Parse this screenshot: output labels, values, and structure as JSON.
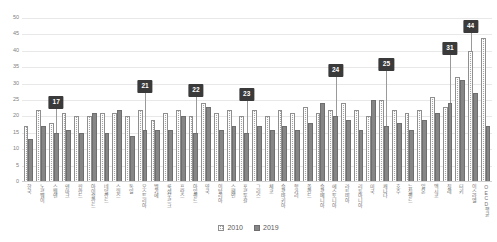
{
  "chart_data": {
    "type": "bar",
    "title": "",
    "subtitle": "",
    "xlabel": "",
    "ylabel": "",
    "ylim": [
      0,
      50
    ],
    "ytick_step": 5,
    "yticks": [
      "0",
      "5",
      "10",
      "15",
      "20",
      "25",
      "30",
      "35",
      "40",
      "45",
      "50"
    ],
    "grid": true,
    "legend_position": "bottom",
    "categories": [
      "한국",
      "노르웨이",
      "스웨덴",
      "덴마크",
      "핀란드",
      "아이슬란드",
      "네덜란드",
      "스위스",
      "독일",
      "오스트리아",
      "벨기에",
      "룩셈부르크",
      "프랑스",
      "아일랜드",
      "영국",
      "이탈리아",
      "스페인",
      "포르투갈",
      "그리스",
      "체코",
      "슬로바키아",
      "헝가리",
      "폴란드",
      "슬로베니아",
      "에스토니아",
      "라트비아",
      "리투아니아",
      "미국",
      "캐나다",
      "호주",
      "뉴질랜드",
      "일본",
      "멕시코",
      "칠레",
      "터키",
      "이스라엘",
      "OECD평균"
    ],
    "series": [
      {
        "name": "2010",
        "values": [
          17,
          22,
          18,
          21,
          20,
          20,
          21,
          21,
          20,
          22,
          19,
          21,
          22,
          20,
          24,
          21,
          22,
          20,
          22,
          20,
          22,
          21,
          23,
          21,
          22,
          24,
          22,
          20,
          25,
          22,
          21,
          22,
          26,
          23,
          32,
          40,
          44
        ]
      },
      {
        "name": "2019",
        "values": [
          13,
          17,
          15,
          16,
          15,
          21,
          15,
          22,
          14,
          16,
          16,
          16,
          20,
          15,
          23,
          16,
          17,
          15,
          17,
          16,
          17,
          16,
          18,
          24,
          20,
          19,
          16,
          25,
          17,
          18,
          16,
          19,
          21,
          24,
          31,
          27,
          17
        ]
      }
    ],
    "annotations": [
      {
        "label": "17",
        "category_index": 2,
        "series": "2019",
        "value": 15
      },
      {
        "label": "21",
        "category_index": 9,
        "series": "2019",
        "value": 16
      },
      {
        "label": "22",
        "category_index": 13,
        "series": "2019",
        "value": 15
      },
      {
        "label": "23",
        "category_index": 17,
        "series": "2019",
        "value": 15
      },
      {
        "label": "24",
        "category_index": 24,
        "series": "2019",
        "value": 20
      },
      {
        "label": "25",
        "category_index": 28,
        "series": "2019",
        "value": 17
      },
      {
        "label": "31",
        "category_index": 33,
        "series": "2019",
        "value": 24
      },
      {
        "label": "44",
        "category_index": 35,
        "series": "2010",
        "value": 40
      }
    ]
  },
  "legend": {
    "items": [
      {
        "label": "2010",
        "color": "#a6a6a6"
      },
      {
        "label": "2019",
        "color": "#868686"
      }
    ]
  },
  "colors": {
    "series_2010": "#a6a6a6",
    "series_2019": "#868686",
    "gridline": "#e8e8e8",
    "callout_bg": "#3a3a3a",
    "callout_text": "#ffffff",
    "axis_text": "#808080"
  }
}
